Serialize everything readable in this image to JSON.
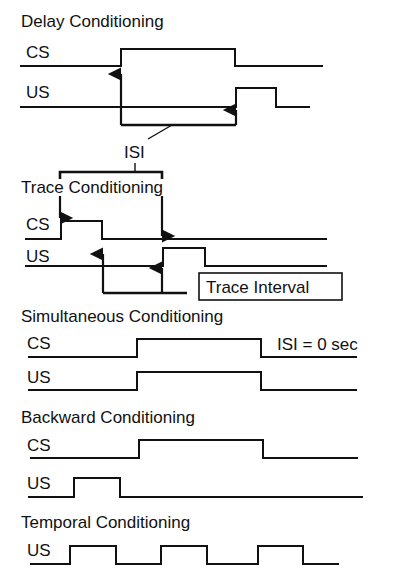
{
  "sections": {
    "delay": {
      "title": "Delay Conditioning",
      "cs_label": "CS",
      "us_label": "US",
      "annotation": "ISI"
    },
    "trace": {
      "title": "Trace Conditioning",
      "cs_label": "CS",
      "us_label": "US",
      "annotation": "ISI",
      "box_label": "Trace Interval"
    },
    "simultaneous": {
      "title": "Simultaneous Conditioning",
      "cs_label": "CS",
      "us_label": "US",
      "annotation": "ISI = 0 sec"
    },
    "backward": {
      "title": "Backward Conditioning",
      "cs_label": "CS",
      "us_label": "US"
    },
    "temporal": {
      "title": "Temporal Conditioning",
      "us_label": "US"
    }
  },
  "colors": {
    "ink": "#111111",
    "background": "#ffffff"
  }
}
